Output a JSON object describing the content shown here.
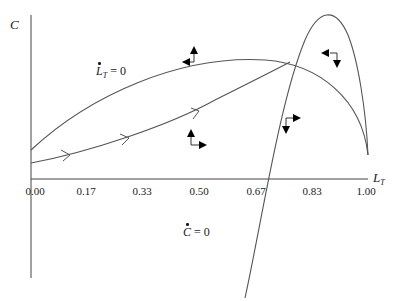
{
  "diagram": {
    "type": "phase-diagram",
    "y_axis": {
      "label": "C"
    },
    "x_axis": {
      "label": "L",
      "label_subscript": "T",
      "ticks": [
        "0.00",
        "0.17",
        "0.33",
        "0.50",
        "0.67",
        "0.83",
        "1.00"
      ]
    },
    "curves": [
      {
        "name": "LT-nullcline",
        "label_var": "L",
        "label_sub": "T",
        "label_rhs": "= 0"
      },
      {
        "name": "C-nullcline",
        "label_var": "C",
        "label_rhs": "= 0"
      }
    ],
    "trajectory": {
      "name": "saddle-path",
      "arrow_count": 3
    },
    "direction_arrows": [
      {
        "region": "upper-left",
        "horizontal": "left",
        "vertical": "up"
      },
      {
        "region": "lower-middle",
        "horizontal": "right",
        "vertical": "up"
      },
      {
        "region": "lower-right",
        "horizontal": "right",
        "vertical": "down"
      },
      {
        "region": "upper-right",
        "horizontal": "left",
        "vertical": "down"
      }
    ],
    "colors": {
      "line": "#555555",
      "axis": "#444444",
      "arrow": "#000000",
      "text": "#1a1a1a"
    }
  }
}
